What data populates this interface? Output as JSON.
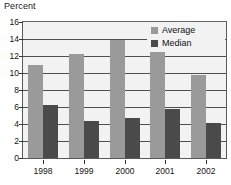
{
  "chart_data": {
    "type": "bar",
    "title": "",
    "xlabel": "",
    "ylabel": "Percent",
    "categories": [
      "1998",
      "1999",
      "2000",
      "2001",
      "2002"
    ],
    "series": [
      {
        "name": "Average",
        "color": "#9a9a9a",
        "values": [
          10.9,
          12.2,
          13.9,
          12.7,
          9.8
        ]
      },
      {
        "name": "Median",
        "color": "#4a4a4a",
        "values": [
          6.2,
          4.3,
          4.7,
          5.8,
          4.1
        ]
      }
    ],
    "ylim": [
      0,
      16
    ],
    "yticks": [
      0,
      2,
      4,
      6,
      8,
      10,
      12,
      14,
      16
    ],
    "ytick_labels": [
      "0",
      "2",
      "4",
      "6",
      "8",
      "10",
      "12",
      "14",
      "16"
    ],
    "grid": true,
    "legend_position": "top-right",
    "plot_background": "#f2f2f2",
    "grid_color": "#4f4f4f",
    "frame_color": "#5a5a5a"
  },
  "legend": {
    "entries": [
      {
        "label": "Average"
      },
      {
        "label": "Median"
      }
    ]
  }
}
